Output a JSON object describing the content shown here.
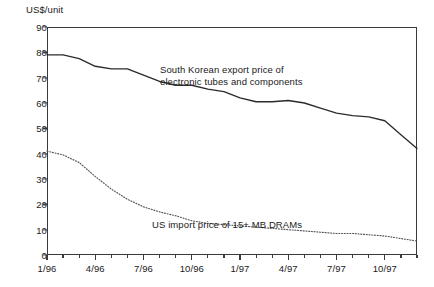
{
  "chart_data": {
    "type": "line",
    "title": "",
    "xlabel": "",
    "ylabel": "US$/unit",
    "ylim": [
      0,
      90
    ],
    "ytick_values": [
      0,
      10,
      20,
      30,
      40,
      50,
      60,
      70,
      80,
      90
    ],
    "grid": false,
    "legend_position": "inline-annotations",
    "x": [
      "1/96",
      "2/96",
      "3/96",
      "4/96",
      "5/96",
      "6/96",
      "7/96",
      "8/96",
      "9/96",
      "10/96",
      "11/96",
      "12/96",
      "1/97",
      "2/97",
      "3/97",
      "4/97",
      "5/97",
      "6/97",
      "7/97",
      "8/97",
      "9/97",
      "10/97",
      "11/97",
      "12/97"
    ],
    "xtick_labels": [
      "1/96",
      "4/96",
      "7/96",
      "10/96",
      "1/97",
      "4/97",
      "7/97",
      "10/97"
    ],
    "xtick_label_indices": [
      0,
      3,
      6,
      9,
      12,
      15,
      18,
      21
    ],
    "series": [
      {
        "name": "South Korean export price of electronic tubes and components",
        "style": "solid",
        "color": "#2b2b2b",
        "annotation": "South Korean export price of\nelectronic tubes and components",
        "values": [
          79.0,
          79.0,
          77.5,
          74.5,
          73.5,
          73.5,
          71.0,
          68.5,
          67.0,
          67.0,
          65.5,
          64.5,
          62.0,
          60.5,
          60.5,
          61.0,
          60.0,
          58.0,
          56.0,
          55.0,
          54.5,
          53.0,
          47.5,
          42.0
        ]
      },
      {
        "name": "US import price of 15+ MB DRAMs",
        "style": "dotted",
        "color": "#555555",
        "annotation": "US import price of 15+ MB DRAMs",
        "values": [
          41.0,
          39.5,
          36.5,
          31.0,
          26.0,
          22.0,
          19.0,
          17.0,
          15.5,
          13.5,
          12.5,
          12.0,
          11.5,
          11.0,
          10.5,
          10.0,
          9.5,
          9.0,
          8.5,
          8.5,
          8.0,
          7.5,
          6.5,
          5.5
        ]
      }
    ]
  }
}
